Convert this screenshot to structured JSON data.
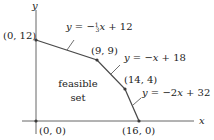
{
  "axes": {
    "x_label": "x",
    "y_label": "y"
  },
  "points": [
    {
      "label": "(0, 12)",
      "x": 0,
      "y": 12
    },
    {
      "label": "(9, 9)",
      "x": 9,
      "y": 9
    },
    {
      "label": "(14, 4)",
      "x": 14,
      "y": 4
    },
    {
      "label": "(16, 0)",
      "x": 16,
      "y": 0
    },
    {
      "label": "(0, 0)",
      "x": 0,
      "y": 0
    }
  ],
  "lines": [
    {
      "equation": "y = −⅓x + 12",
      "eq_prefix": "y = −",
      "frac": "1/3",
      "eq_suffix": "x + 12"
    },
    {
      "equation": "y = −x + 18"
    },
    {
      "equation": "y = −2x + 32"
    }
  ],
  "region": {
    "label_line1": "feasible",
    "label_line2": "set"
  },
  "colors": {
    "line": "#4a4a4a",
    "axis": "#666666",
    "point": "#3a3a3a"
  }
}
